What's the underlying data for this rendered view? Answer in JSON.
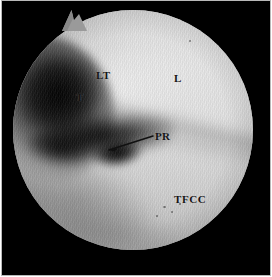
{
  "figure": {
    "kind": "arthroscopic-photograph",
    "modality_note": "wrist arthroscopy view",
    "frame": {
      "background_color": "#000000",
      "border_color": "#b9b9b9",
      "field_shape": "circle",
      "field_base_color": "#c8c8c8"
    },
    "annotations": {
      "label_color": "#141414",
      "leader_color": "#111111",
      "items": [
        {
          "id": "lt",
          "text": "LT",
          "meaning": "lunotriquetral ligament",
          "x": 94,
          "y": 69
        },
        {
          "id": "l",
          "text": "L",
          "meaning": "lunate",
          "x": 172,
          "y": 72
        },
        {
          "id": "t",
          "text": "T",
          "meaning": "triquetrum",
          "x": 74,
          "y": 91
        },
        {
          "id": "pr",
          "text": "PR",
          "meaning": "prestyloid recess",
          "x": 153,
          "y": 130
        },
        {
          "id": "tfcc",
          "text": "TFCC",
          "meaning": "triangular fibrocartilage complex",
          "x": 172,
          "y": 193
        }
      ],
      "leader_lines": [
        {
          "id": "pr-leader",
          "from_x": 107,
          "from_y": 149,
          "to_x": 151,
          "to_y": 135
        }
      ]
    }
  }
}
